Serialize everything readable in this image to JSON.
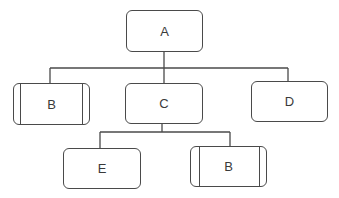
{
  "diagram": {
    "type": "hierarchy-tree",
    "nodes": [
      {
        "id": "A",
        "label": "A",
        "shape": "rounded-rect",
        "level": 0
      },
      {
        "id": "B1",
        "label": "B",
        "shape": "rounded-rect-with-side-bars",
        "level": 1,
        "parent": "A"
      },
      {
        "id": "C",
        "label": "C",
        "shape": "rounded-rect",
        "level": 1,
        "parent": "A"
      },
      {
        "id": "D",
        "label": "D",
        "shape": "rounded-rect",
        "level": 1,
        "parent": "A"
      },
      {
        "id": "E",
        "label": "E",
        "shape": "rounded-rect",
        "level": 2,
        "parent": "C"
      },
      {
        "id": "B2",
        "label": "B",
        "shape": "rounded-rect-with-side-bars",
        "level": 2,
        "parent": "C"
      }
    ],
    "edges": [
      {
        "from": "A",
        "to": "B1"
      },
      {
        "from": "A",
        "to": "C"
      },
      {
        "from": "A",
        "to": "D"
      },
      {
        "from": "C",
        "to": "E"
      },
      {
        "from": "C",
        "to": "B2"
      }
    ],
    "colors": {
      "stroke": "#4a4a4a",
      "text": "#3a3a3a",
      "background": "#ffffff"
    }
  }
}
